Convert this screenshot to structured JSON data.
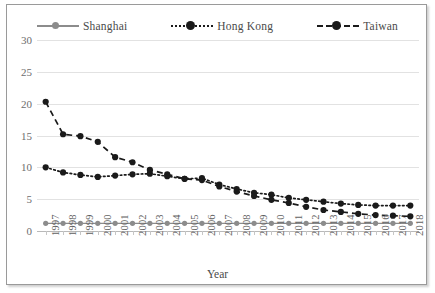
{
  "chart_data": {
    "type": "line",
    "title": "",
    "xlabel": "Year",
    "ylabel": "",
    "ylim": [
      0,
      30
    ],
    "yticks": [
      0,
      5,
      10,
      15,
      20,
      25,
      30
    ],
    "grid": true,
    "legend_position": "top",
    "categories": [
      "1997",
      "1998",
      "1999",
      "2000",
      "2001",
      "2002",
      "2003",
      "2004",
      "2005",
      "2006",
      "2007",
      "2008",
      "2009",
      "2010",
      "2011",
      "2012",
      "2013",
      "2014",
      "2015",
      "2016",
      "2017",
      "2018"
    ],
    "series": [
      {
        "name": "Shanghai",
        "color": "#8c8c8c",
        "line_style": "solid",
        "marker": "circle",
        "values": [
          1.2,
          1.2,
          1.2,
          1.2,
          1.2,
          1.2,
          1.2,
          1.2,
          1.2,
          1.2,
          1.2,
          1.2,
          1.2,
          1.2,
          1.2,
          1.2,
          1.2,
          1.2,
          1.2,
          1.2,
          1.2,
          1.2
        ]
      },
      {
        "name": "Hong Kong",
        "color": "#1a1a1a",
        "line_style": "dotted",
        "marker": "circle",
        "values": [
          10.0,
          9.2,
          8.8,
          8.5,
          8.7,
          8.9,
          9.0,
          8.6,
          8.2,
          8.3,
          7.3,
          6.6,
          6.0,
          5.7,
          5.2,
          4.9,
          4.6,
          4.3,
          4.1,
          4.0,
          4.0,
          4.0
        ]
      },
      {
        "name": "Taiwan",
        "color": "#1a1a1a",
        "line_style": "dashed",
        "marker": "circle",
        "values": [
          20.3,
          15.2,
          14.9,
          14.0,
          11.6,
          10.8,
          9.6,
          8.9,
          8.2,
          8.0,
          7.0,
          6.2,
          5.5,
          4.9,
          4.4,
          3.8,
          3.3,
          3.0,
          2.7,
          2.5,
          2.4,
          2.3
        ]
      }
    ]
  },
  "legend": {
    "items": [
      {
        "label": "Shanghai"
      },
      {
        "label": "Hong Kong"
      },
      {
        "label": "Taiwan"
      }
    ]
  },
  "axes": {
    "x_title": "Year"
  }
}
